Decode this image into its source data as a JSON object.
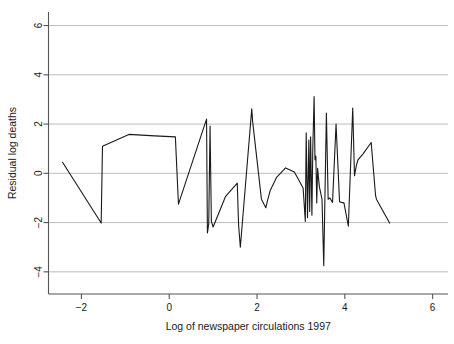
{
  "chart_data": {
    "type": "line",
    "title": "",
    "subtitle": "",
    "xlabel": "Log of newspaper circulations 1997",
    "ylabel": "Residual log deaths",
    "xlim": [
      -2.75,
      6.35
    ],
    "ylim": [
      -4.9,
      6.55
    ],
    "xticks": [
      -2,
      0,
      2,
      4,
      6
    ],
    "xticklabels": [
      "−2",
      "0",
      "2",
      "4",
      "6"
    ],
    "yticks": [
      -4,
      -2,
      0,
      2,
      4,
      6
    ],
    "yticklabels": [
      "−4",
      "−2",
      "0",
      "2",
      "4",
      "6"
    ],
    "grid": "horizontal",
    "grid_color": "#b4b4b4",
    "line_color": "#1a1a1a",
    "line_width": 1.1,
    "legend": null,
    "legend_position": "none",
    "series": [
      {
        "name": "Residual log deaths",
        "x": [
          -2.43,
          -1.55,
          -1.52,
          -0.92,
          -0.33,
          0.14,
          0.21,
          0.85,
          0.87,
          0.9,
          0.93,
          0.96,
          1.0,
          1.28,
          1.55,
          1.58,
          1.62,
          1.88,
          1.9,
          2.1,
          2.2,
          2.24,
          2.3,
          2.45,
          2.65,
          2.85,
          3.05,
          3.1,
          3.12,
          3.15,
          3.18,
          3.2,
          3.22,
          3.25,
          3.27,
          3.3,
          3.32,
          3.34,
          3.36,
          3.38,
          3.42,
          3.48,
          3.52,
          3.58,
          3.62,
          3.66,
          3.72,
          3.8,
          3.88,
          3.92,
          3.98,
          4.08,
          4.18,
          4.22,
          4.26,
          4.3,
          4.42,
          4.6,
          4.7,
          4.72,
          5.02
        ],
        "y": [
          0.45,
          -2.02,
          1.1,
          1.58,
          1.52,
          1.48,
          -1.25,
          2.2,
          -2.42,
          -2.05,
          1.92,
          -1.95,
          -2.18,
          -0.95,
          -0.4,
          -2.1,
          -3.0,
          2.62,
          2.1,
          -1.05,
          -1.4,
          -1.1,
          -0.7,
          -0.15,
          0.22,
          0.05,
          -0.6,
          -1.95,
          1.65,
          -1.8,
          1.35,
          -1.55,
          1.48,
          -1.7,
          0.95,
          3.12,
          0.55,
          0.7,
          -1.2,
          0.2,
          -0.55,
          -1.05,
          -3.75,
          2.45,
          -1.05,
          -1.0,
          -1.18,
          2.0,
          -1.15,
          -1.18,
          -1.2,
          -2.15,
          2.65,
          -0.1,
          0.3,
          0.55,
          0.8,
          1.25,
          -0.9,
          -1.05,
          -2.02
        ]
      }
    ]
  },
  "axes": {
    "x_axis_label": "Log of newspaper circulations 1997",
    "y_axis_label": "Residual log deaths"
  }
}
